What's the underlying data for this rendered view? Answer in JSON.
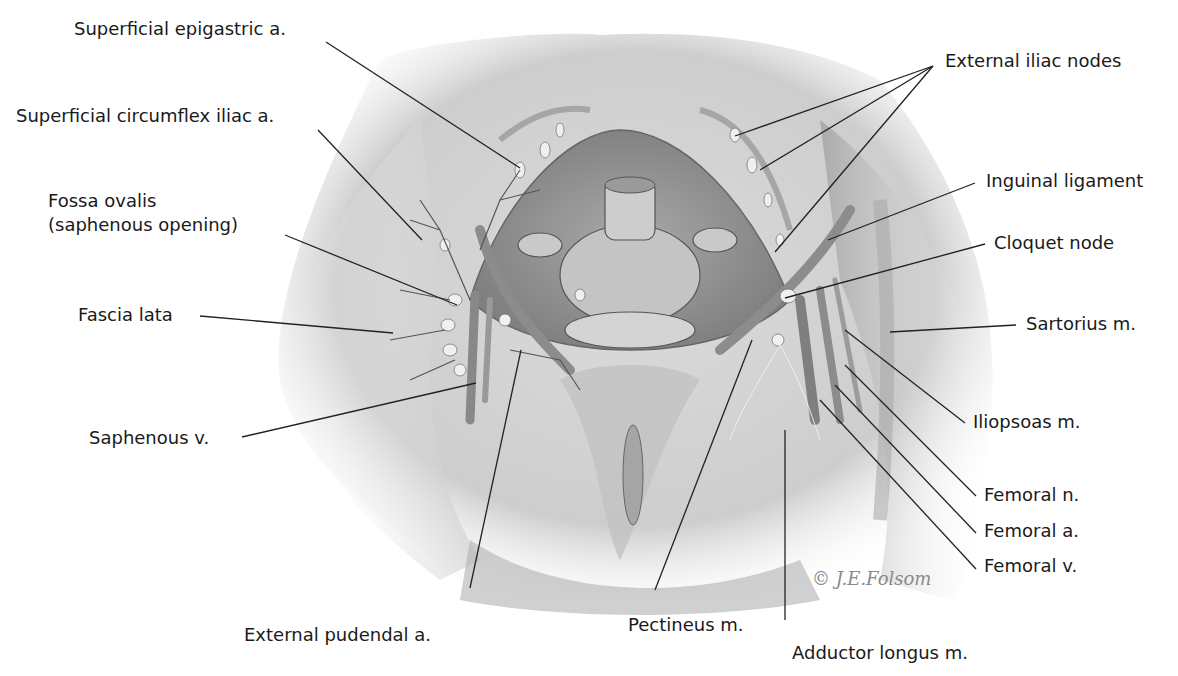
{
  "figure": {
    "signature": "© J.E.Folsom"
  },
  "labels": {
    "superficial_epigastric": "Superficial epigastric a.",
    "superficial_circumflex": "Superficial circumflex iliac a.",
    "fossa_ovalis_line1": "Fossa ovalis",
    "fossa_ovalis_line2": "(saphenous opening)",
    "fascia_lata": "Fascia lata",
    "saphenous_v": "Saphenous v.",
    "external_pudendal": "External pudendal a.",
    "pectineus": "Pectineus m.",
    "adductor_longus": "Adductor longus m.",
    "external_iliac_nodes": "External iliac nodes",
    "inguinal_ligament": "Inguinal ligament",
    "cloquet_node": "Cloquet node",
    "sartorius": "Sartorius m.",
    "iliopsoas": "Iliopsoas m.",
    "femoral_n": "Femoral n.",
    "femoral_a": "Femoral a.",
    "femoral_v": "Femoral v."
  },
  "colors": {
    "text": "#1a1a1a",
    "leader_line": "#222222",
    "tissue_light": "#d9d9d9",
    "tissue_mid": "#b5b5b5",
    "tissue_dark": "#8a8a8a",
    "background": "#ffffff"
  }
}
